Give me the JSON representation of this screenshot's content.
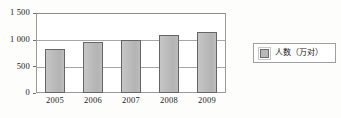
{
  "chart_data": {
    "type": "bar",
    "title": "",
    "xlabel": "",
    "ylabel": "",
    "categories": [
      "2005",
      "2006",
      "2007",
      "2008",
      "2009"
    ],
    "values": [
      830,
      950,
      1000,
      1080,
      1150
    ],
    "series": [
      {
        "name": "人数（万对）",
        "values": [
          830,
          950,
          1000,
          1080,
          1150
        ]
      }
    ],
    "ylim": [
      0,
      1500
    ],
    "y_ticks": [
      0,
      500,
      1000,
      1500
    ],
    "y_tick_labels": [
      "0",
      "500",
      "1 000",
      "1 500"
    ],
    "grid": true,
    "legend_position": "right",
    "legend_entries": [
      "人数（万对）"
    ],
    "bar_color": "#b9b9b9",
    "bar_border_color": "#666666",
    "grid_color": "#a8a8a8",
    "frame_color": "#9a9a9a"
  },
  "legend": {
    "label": "人数（万对）",
    "swatch_icon": "square-swatch-icon"
  },
  "axes": {
    "y_labels": [
      "1 500",
      "1 000",
      "500",
      "0"
    ],
    "x_labels": [
      "2005",
      "2006",
      "2007",
      "2008",
      "2009"
    ]
  }
}
